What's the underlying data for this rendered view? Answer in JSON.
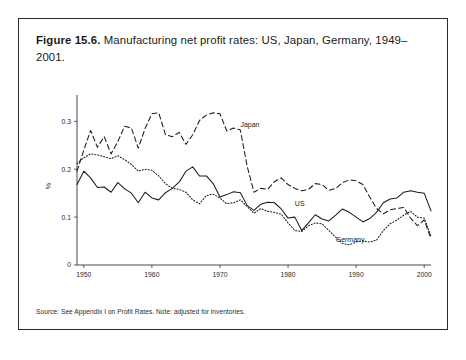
{
  "caption": {
    "figure_label": "Figure 15.6.",
    "text": " Manufacturing net profit rates: US, Japan, Germany, 1949–2001."
  },
  "source_note": "Source: See Appendix I on Profit Rates. Note: adjusted for inventories.",
  "chart_data": {
    "type": "line",
    "title": "Manufacturing net profit rates: US, Japan, Germany, 1949–2001",
    "xlabel": "",
    "ylabel": "%",
    "xlim": [
      1949,
      2001
    ],
    "ylim": [
      0,
      0.33
    ],
    "grid": false,
    "legend": "inline-annotations",
    "x_ticks": [
      1950,
      1960,
      1970,
      1980,
      1990,
      2000
    ],
    "x_tick_labels": [
      "1950",
      "1960",
      "1970",
      "1980",
      "1990",
      "2000"
    ],
    "y_ticks": [
      0,
      0.1,
      0.2,
      0.3
    ],
    "y_tick_labels": [
      "0",
      "0.1",
      "0.2",
      "0.3"
    ],
    "x": [
      1949,
      1950,
      1951,
      1952,
      1953,
      1954,
      1955,
      1956,
      1957,
      1958,
      1959,
      1960,
      1961,
      1962,
      1963,
      1964,
      1965,
      1966,
      1967,
      1968,
      1969,
      1970,
      1971,
      1972,
      1973,
      1974,
      1975,
      1976,
      1977,
      1978,
      1979,
      1980,
      1981,
      1982,
      1983,
      1984,
      1985,
      1986,
      1987,
      1988,
      1989,
      1990,
      1991,
      1992,
      1993,
      1994,
      1995,
      1996,
      1997,
      1998,
      1999,
      2000,
      2001
    ],
    "series": [
      {
        "name": "US",
        "style": "solid",
        "label_x": 1981,
        "label_y": 0.123,
        "values": [
          0.168,
          0.196,
          0.182,
          0.162,
          0.163,
          0.152,
          0.172,
          0.159,
          0.15,
          0.13,
          0.152,
          0.14,
          0.136,
          0.151,
          0.16,
          0.173,
          0.196,
          0.205,
          0.186,
          0.186,
          0.17,
          0.142,
          0.147,
          0.153,
          0.151,
          0.124,
          0.114,
          0.127,
          0.131,
          0.13,
          0.117,
          0.098,
          0.1,
          0.072,
          0.088,
          0.105,
          0.096,
          0.092,
          0.104,
          0.117,
          0.11,
          0.1,
          0.09,
          0.097,
          0.11,
          0.13,
          0.138,
          0.14,
          0.152,
          0.155,
          0.152,
          0.15,
          0.113
        ]
      },
      {
        "name": "Japan",
        "style": "dashed",
        "label_x": 1973,
        "label_y": 0.288,
        "values": [
          0.196,
          0.24,
          0.281,
          0.246,
          0.268,
          0.232,
          0.258,
          0.29,
          0.286,
          0.244,
          0.285,
          0.316,
          0.318,
          0.272,
          0.268,
          0.277,
          0.252,
          0.272,
          0.302,
          0.313,
          0.318,
          0.316,
          0.28,
          0.286,
          0.282,
          0.206,
          0.152,
          0.16,
          0.158,
          0.174,
          0.182,
          0.168,
          0.16,
          0.155,
          0.158,
          0.17,
          0.168,
          0.156,
          0.16,
          0.172,
          0.178,
          0.176,
          0.168,
          0.142,
          0.118,
          0.107,
          0.115,
          0.118,
          0.12,
          0.098,
          0.082,
          0.094,
          0.055
        ]
      },
      {
        "name": "Germany",
        "style": "dotted",
        "label_x": 1987,
        "label_y": 0.048,
        "values": [
          0.212,
          0.224,
          0.232,
          0.23,
          0.226,
          0.222,
          0.228,
          0.22,
          0.21,
          0.196,
          0.2,
          0.198,
          0.186,
          0.17,
          0.16,
          0.158,
          0.152,
          0.136,
          0.128,
          0.145,
          0.148,
          0.14,
          0.128,
          0.13,
          0.136,
          0.122,
          0.108,
          0.118,
          0.112,
          0.11,
          0.106,
          0.088,
          0.072,
          0.07,
          0.082,
          0.088,
          0.086,
          0.072,
          0.058,
          0.045,
          0.042,
          0.048,
          0.05,
          0.048,
          0.052,
          0.072,
          0.086,
          0.094,
          0.104,
          0.112,
          0.1,
          0.098,
          0.06
        ]
      }
    ]
  }
}
